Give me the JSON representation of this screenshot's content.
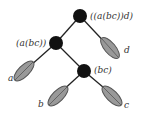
{
  "diagram": {
    "type": "tree",
    "nodes": {
      "root": {
        "label": "((a(bc))d)"
      },
      "inner_left": {
        "label": "(a(bc))"
      },
      "inner_bc": {
        "label": "(bc)"
      }
    },
    "leaves": {
      "a": {
        "label": "a"
      },
      "b": {
        "label": "b"
      },
      "c": {
        "label": "c"
      },
      "d": {
        "label": "d"
      }
    },
    "colors": {
      "node_fill": "#111111",
      "leaf_fill": "#999999",
      "leaf_stroke": "#555555",
      "edge": "#222222"
    }
  }
}
